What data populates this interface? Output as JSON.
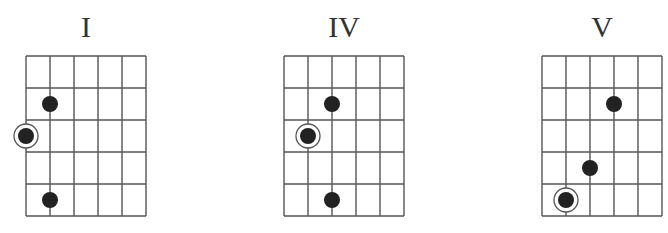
{
  "grid": {
    "strings": 6,
    "frets": 5,
    "col_width": 24,
    "row_height": 32,
    "line_color": "#555555",
    "dot_color": "#222222"
  },
  "diagrams": [
    {
      "label": "I",
      "origin_x": 26,
      "origin_y": 56,
      "dots": [
        {
          "string": 2,
          "fret": 2,
          "root": false
        },
        {
          "string": 1,
          "fret": 3,
          "root": true
        },
        {
          "string": 2,
          "fret": 5,
          "root": false
        }
      ]
    },
    {
      "label": "IV",
      "origin_x": 284,
      "origin_y": 56,
      "dots": [
        {
          "string": 3,
          "fret": 2,
          "root": false
        },
        {
          "string": 2,
          "fret": 3,
          "root": true
        },
        {
          "string": 3,
          "fret": 5,
          "root": false
        }
      ]
    },
    {
      "label": "V",
      "origin_x": 542,
      "origin_y": 56,
      "dots": [
        {
          "string": 4,
          "fret": 2,
          "root": false
        },
        {
          "string": 3,
          "fret": 4,
          "root": false
        },
        {
          "string": 2,
          "fret": 5,
          "root": true
        }
      ]
    }
  ]
}
